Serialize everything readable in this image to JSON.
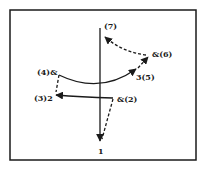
{
  "diagram": {
    "type": "move-sequence diagram",
    "frame": {
      "stroke": "#1a1a1a"
    },
    "labels": {
      "top": "(7)",
      "bottom": "1",
      "upper_left": "(4)&",
      "upper_right": "&(6)",
      "mid_right": "3(5)",
      "lower_left": "(3)2",
      "lower_right": "&(2)"
    },
    "edges": [
      {
        "from": "lower_right",
        "to": "bottom",
        "style": "dashed",
        "arrow": true
      },
      {
        "from": "lower_right",
        "to": "lower_left",
        "style": "solid",
        "arrow": true
      },
      {
        "from": "lower_left",
        "to": "upper_left",
        "style": "dashed",
        "arrow": false
      },
      {
        "from": "upper_left",
        "to": "mid_right",
        "style": "solid",
        "arrow": true
      },
      {
        "from": "mid_right",
        "to": "upper_right",
        "style": "dashed",
        "arrow": true
      },
      {
        "from": "upper_right",
        "to": "top",
        "style": "dashed",
        "arrow": true
      },
      {
        "from": "top",
        "to": "bottom",
        "style": "solid",
        "arrow": true
      }
    ],
    "colors": {
      "ink": "#1a1a1a",
      "background": "#ffffff"
    }
  }
}
